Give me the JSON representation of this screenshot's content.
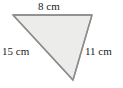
{
  "figure": {
    "type": "triangle",
    "shape_name": "scalene-triangle",
    "fill_color": "#ececeb",
    "stroke_color": "#8d8d8d",
    "background_color": "#ffffff",
    "text_color": "#1a1a1a",
    "vertices": [
      {
        "name": "top-left",
        "x": 13,
        "y": 15
      },
      {
        "name": "top-right",
        "x": 92,
        "y": 15
      },
      {
        "name": "bottom",
        "x": 73,
        "y": 80
      }
    ],
    "labels": {
      "top": "8 cm",
      "left": "15 cm",
      "right": "11 cm"
    },
    "measurements": [
      {
        "side": "top",
        "value": 8,
        "unit": "cm",
        "text": "8 cm"
      },
      {
        "side": "left",
        "value": 15,
        "unit": "cm",
        "text": "15 cm"
      },
      {
        "side": "right",
        "value": 11,
        "unit": "cm",
        "text": "11 cm"
      }
    ]
  }
}
